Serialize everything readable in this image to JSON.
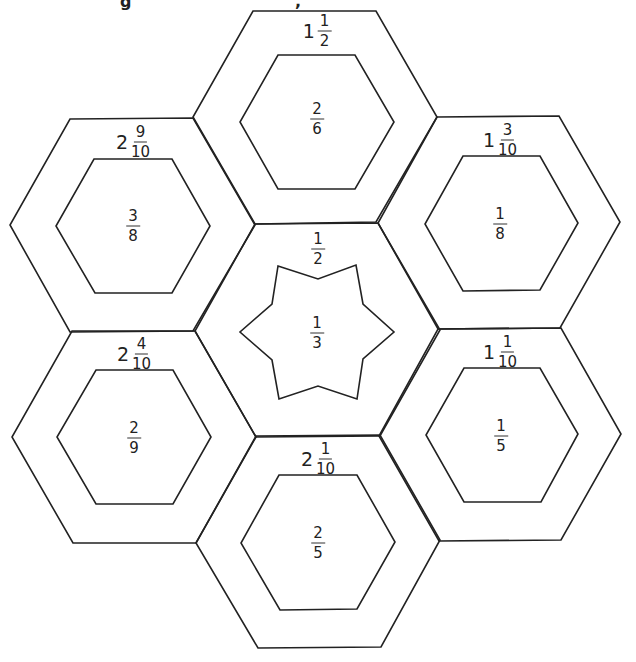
{
  "title_fragments": [
    "g",
    ","
  ],
  "stroke_color": "#222222",
  "hexagons": [
    {
      "id": "top",
      "outer_label": {
        "whole": "1",
        "num": "1",
        "den": "2"
      },
      "inner_label": {
        "num": "2",
        "den": "6"
      },
      "outer": "253,11 376,11 437,117 376,222 255,224 193,117",
      "inner": "278,55 355,55 394,122 355,189 278,189 240,122",
      "outer_pos": [
        317,
        31
      ],
      "inner_pos": [
        317,
        119
      ]
    },
    {
      "id": "upper-left",
      "outer_label": {
        "whole": "2",
        "num": "9",
        "den": "10"
      },
      "inner_label": {
        "num": "3",
        "den": "8"
      },
      "outer": "70,119 193,118 255,225 193,331 70,332 10,225",
      "inner": "94,159 172,159 210,226 172,293 95,293 56,226",
      "outer_pos": [
        133,
        142
      ],
      "inner_pos": [
        133,
        226
      ]
    },
    {
      "id": "upper-right",
      "outer_label": {
        "whole": "1",
        "num": "3",
        "den": "10"
      },
      "inner_label": {
        "num": "1",
        "den": "8"
      },
      "outer": "437,117 559,116 620,222 560,328 438,329 378,223",
      "inner": "463,156 540,156 578,223 540,290 463,291 425,224",
      "outer_pos": [
        500,
        140
      ],
      "inner_pos": [
        500,
        224
      ]
    },
    {
      "id": "center",
      "outer_label": {
        "whole": "",
        "num": "1",
        "den": "2"
      },
      "inner_label": {
        "num": "1",
        "den": "3"
      },
      "outer": "255,224 378,223 440,330 380,436 256,437 195,331",
      "inner": "278,266 318,279 356,265 363,304 394,332 363,359 357,399 318,386 279,399 272,360 240,332 272,304",
      "outer_pos": [
        318,
        249
      ],
      "inner_pos": [
        317,
        333
      ],
      "inner_shape": "star"
    },
    {
      "id": "lower-left",
      "outer_label": {
        "whole": "2",
        "num": "4",
        "den": "10"
      },
      "inner_label": {
        "num": "2",
        "den": "9"
      },
      "outer": "72,331 195,331 256,437 196,543 73,543 12,437",
      "inner": "96,370 173,370 211,437 173,504 96,504 57,437",
      "outer_pos": [
        134,
        354
      ],
      "inner_pos": [
        134,
        438
      ]
    },
    {
      "id": "lower-right",
      "outer_label": {
        "whole": "1",
        "num": "1",
        "den": "10"
      },
      "inner_label": {
        "num": "1",
        "den": "5"
      },
      "outer": "438,329 561,328 621,434 561,540 439,541 379,436",
      "inner": "464,368 540,368 578,434 541,502 464,502 426,435",
      "outer_pos": [
        500,
        352
      ],
      "inner_pos": [
        501,
        436
      ]
    },
    {
      "id": "bottom",
      "outer_label": {
        "whole": "2",
        "num": "1",
        "den": "10"
      },
      "inner_label": {
        "num": "2",
        "den": "5"
      },
      "outer": "256,436 380,435 440,540 381,647 258,648 196,543",
      "inner": "279,475 357,475 395,542 357,609 280,610 241,543",
      "outer_pos": [
        318,
        459
      ],
      "inner_pos": [
        318,
        543
      ]
    }
  ]
}
